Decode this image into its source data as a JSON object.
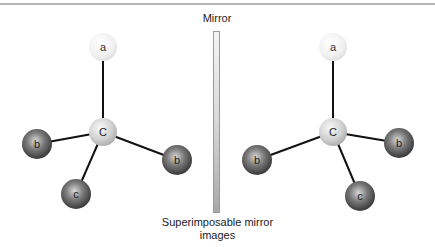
{
  "mirror": {
    "label": "Mirror"
  },
  "caption": {
    "line1": "Superimposable mirror",
    "line2": "images"
  },
  "colors": {
    "light_atom": "#eeeeee",
    "center_atom": "#d4d4d4",
    "dark_atom": "#555555",
    "bond": "#111111"
  },
  "left_molecule": {
    "atoms": [
      {
        "id": "a",
        "label": "a",
        "x": 103,
        "y": 47,
        "r": 14,
        "type": "light"
      },
      {
        "id": "C",
        "label": "C",
        "x": 103,
        "y": 132,
        "r": 14,
        "type": "center"
      },
      {
        "id": "b1",
        "label": "b",
        "x": 37,
        "y": 144,
        "r": 15,
        "type": "dark"
      },
      {
        "id": "b2",
        "label": "b",
        "x": 177,
        "y": 160,
        "r": 15,
        "type": "dark"
      },
      {
        "id": "c",
        "label": "c",
        "x": 76,
        "y": 194,
        "r": 15,
        "type": "dark"
      }
    ]
  },
  "right_molecule": {
    "atoms": [
      {
        "id": "a",
        "label": "a",
        "x": 333,
        "y": 47,
        "r": 14,
        "type": "light"
      },
      {
        "id": "C",
        "label": "C",
        "x": 333,
        "y": 132,
        "r": 14,
        "type": "center"
      },
      {
        "id": "b1",
        "label": "b",
        "x": 257,
        "y": 160,
        "r": 15,
        "type": "dark"
      },
      {
        "id": "b2",
        "label": "b",
        "x": 399,
        "y": 143,
        "r": 15,
        "type": "dark"
      },
      {
        "id": "c",
        "label": "c",
        "x": 360,
        "y": 196,
        "r": 15,
        "type": "dark"
      }
    ]
  }
}
